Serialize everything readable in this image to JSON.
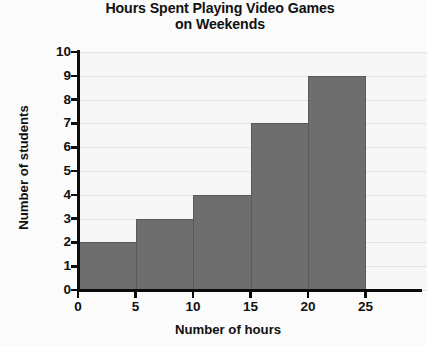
{
  "chart_data": {
    "type": "bar",
    "title": "Hours Spent Playing Video Games on Weekends",
    "title_lines": [
      "Hours Spent Playing Video Games",
      "on Weekends"
    ],
    "xlabel": "Number of hours",
    "ylabel": "Number of students",
    "categories": [
      "0-5",
      "5-10",
      "10-15",
      "15-20",
      "20-25"
    ],
    "bin_edges": [
      0,
      5,
      10,
      15,
      20,
      25
    ],
    "values": [
      2,
      3,
      4,
      7,
      9
    ],
    "bars": [
      {
        "label": "0-5",
        "start": 0,
        "end": 5,
        "value": 2
      },
      {
        "label": "5-10",
        "start": 5,
        "end": 10,
        "value": 3
      },
      {
        "label": "10-15",
        "start": 10,
        "end": 15,
        "value": 4
      },
      {
        "label": "15-20",
        "start": 15,
        "end": 20,
        "value": 7
      },
      {
        "label": "20-25",
        "start": 20,
        "end": 25,
        "value": 9
      }
    ],
    "xlim": [
      0,
      25
    ],
    "ylim": [
      0,
      10
    ],
    "xticks": [
      0,
      5,
      10,
      15,
      20,
      25
    ],
    "yticks": [
      0,
      1,
      2,
      3,
      4,
      5,
      6,
      7,
      8,
      9,
      10
    ],
    "xtick_labels": [
      "0",
      "5",
      "10",
      "15",
      "20",
      "25"
    ],
    "ytick_labels": [
      "0",
      "1",
      "2",
      "3",
      "4",
      "5",
      "6",
      "7",
      "8",
      "9",
      "10"
    ],
    "grid": true,
    "grid_axis": "y",
    "legend": null,
    "bar_color": "#6e6e6e",
    "grid_color": "#e3e3e3",
    "axis_color": "#0b0b0b",
    "plot_background": "#f7f7f7"
  }
}
